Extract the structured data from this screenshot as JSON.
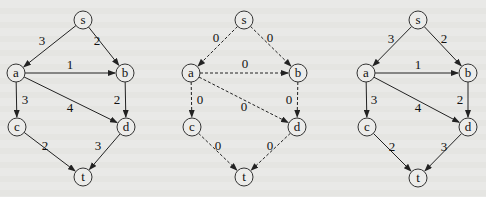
{
  "graphs": [
    {
      "id": "network",
      "style": "solid",
      "nodes": [
        {
          "id": "s",
          "label": "s",
          "x": 83,
          "y": 20
        },
        {
          "id": "a",
          "label": "a",
          "x": 16,
          "y": 73
        },
        {
          "id": "b",
          "label": "b",
          "x": 125,
          "y": 73
        },
        {
          "id": "c",
          "label": "c",
          "x": 17,
          "y": 127
        },
        {
          "id": "d",
          "label": "d",
          "x": 126,
          "y": 127
        },
        {
          "id": "t",
          "label": "t",
          "x": 83,
          "y": 177
        }
      ],
      "edges": [
        {
          "from": "s",
          "to": "a",
          "label": "3",
          "lx": 42,
          "ly": 40
        },
        {
          "from": "s",
          "to": "b",
          "label": "2",
          "lx": 97,
          "ly": 40
        },
        {
          "from": "a",
          "to": "b",
          "label": "1",
          "lx": 70,
          "ly": 64
        },
        {
          "from": "a",
          "to": "c",
          "label": "3",
          "lx": 25,
          "ly": 99
        },
        {
          "from": "a",
          "to": "d",
          "label": "4",
          "lx": 70,
          "ly": 107
        },
        {
          "from": "b",
          "to": "d",
          "label": "2",
          "lx": 117,
          "ly": 99
        },
        {
          "from": "c",
          "to": "t",
          "label": "2",
          "lx": 45,
          "ly": 145
        },
        {
          "from": "d",
          "to": "t",
          "label": "3",
          "lx": 98,
          "ly": 145
        }
      ]
    },
    {
      "id": "zero-flow",
      "style": "dashed",
      "nodes": [
        {
          "id": "s",
          "label": "s",
          "x": 244,
          "y": 20
        },
        {
          "id": "a",
          "label": "a",
          "x": 191,
          "y": 73
        },
        {
          "id": "b",
          "label": "b",
          "x": 298,
          "y": 73
        },
        {
          "id": "c",
          "label": "c",
          "x": 192,
          "y": 127
        },
        {
          "id": "d",
          "label": "d",
          "x": 297,
          "y": 127
        },
        {
          "id": "t",
          "label": "t",
          "x": 244,
          "y": 177
        }
      ],
      "edges": [
        {
          "from": "s",
          "to": "a",
          "label": "0",
          "lx": 216,
          "ly": 37
        },
        {
          "from": "s",
          "to": "b",
          "label": "0",
          "lx": 270,
          "ly": 37
        },
        {
          "from": "a",
          "to": "b",
          "label": "0",
          "lx": 245,
          "ly": 63
        },
        {
          "from": "a",
          "to": "c",
          "label": "0",
          "lx": 200,
          "ly": 99
        },
        {
          "from": "a",
          "to": "d",
          "label": "0",
          "lx": 244,
          "ly": 106
        },
        {
          "from": "b",
          "to": "d",
          "label": "0",
          "lx": 289,
          "ly": 99
        },
        {
          "from": "c",
          "to": "t",
          "label": "0",
          "lx": 218,
          "ly": 145
        },
        {
          "from": "d",
          "to": "t",
          "label": "0",
          "lx": 270,
          "ly": 145
        }
      ]
    },
    {
      "id": "residual",
      "style": "solid",
      "nodes": [
        {
          "id": "s",
          "label": "s",
          "x": 418,
          "y": 20
        },
        {
          "id": "a",
          "label": "a",
          "x": 366,
          "y": 73
        },
        {
          "id": "b",
          "label": "b",
          "x": 468,
          "y": 73
        },
        {
          "id": "c",
          "label": "c",
          "x": 367,
          "y": 127
        },
        {
          "id": "d",
          "label": "d",
          "x": 468,
          "y": 127
        },
        {
          "id": "t",
          "label": "t",
          "x": 418,
          "y": 178
        }
      ],
      "edges": [
        {
          "from": "s",
          "to": "a",
          "label": "3",
          "lx": 391,
          "ly": 38
        },
        {
          "from": "s",
          "to": "b",
          "label": "2",
          "lx": 444,
          "ly": 38
        },
        {
          "from": "a",
          "to": "b",
          "label": "1",
          "lx": 418,
          "ly": 64
        },
        {
          "from": "a",
          "to": "c",
          "label": "3",
          "lx": 374,
          "ly": 99
        },
        {
          "from": "a",
          "to": "d",
          "label": "4",
          "lx": 418,
          "ly": 107
        },
        {
          "from": "b",
          "to": "d",
          "label": "2",
          "lx": 460,
          "ly": 99
        },
        {
          "from": "c",
          "to": "t",
          "label": "2",
          "lx": 392,
          "ly": 146
        },
        {
          "from": "d",
          "to": "t",
          "label": "3",
          "lx": 444,
          "ly": 146
        }
      ]
    }
  ]
}
